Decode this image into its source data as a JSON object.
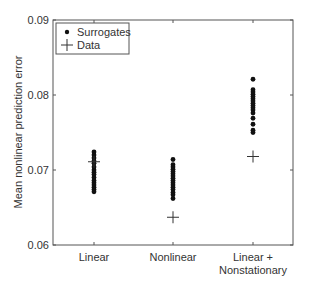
{
  "chart_data": {
    "type": "scatter",
    "title": "",
    "xlabel": "",
    "ylabel": "Mean nonlinear prediction error",
    "ylim": [
      0.06,
      0.09
    ],
    "yticks": [
      "0.06",
      "0.07",
      "0.08",
      "0.09"
    ],
    "categories": [
      "Linear",
      "Nonlinear",
      "Linear + Nonstationary"
    ],
    "category_labels": [
      [
        "Linear"
      ],
      [
        "Nonlinear"
      ],
      [
        "Linear +",
        "Nonstationary"
      ]
    ],
    "grid": false,
    "legend": {
      "position": "upper left",
      "entries": [
        "Surrogates",
        "Data"
      ]
    },
    "series": [
      {
        "name": "Surrogates",
        "marker": "dot",
        "values": [
          [
            0.0724,
            0.072,
            0.0716,
            0.0712,
            0.0709,
            0.0704,
            0.07,
            0.0697,
            0.0694,
            0.069,
            0.0686,
            0.0683,
            0.068,
            0.0677,
            0.0674,
            0.0671
          ],
          [
            0.0714,
            0.0707,
            0.0704,
            0.0701,
            0.0698,
            0.0695,
            0.0692,
            0.0689,
            0.0686,
            0.0683,
            0.068,
            0.0677,
            0.0674,
            0.067,
            0.0667,
            0.0662
          ],
          [
            0.0821,
            0.0807,
            0.0804,
            0.0801,
            0.0798,
            0.0795,
            0.0792,
            0.0789,
            0.0786,
            0.0783,
            0.078,
            0.0776,
            0.0769,
            0.0761,
            0.0753,
            0.075
          ]
        ]
      },
      {
        "name": "Data",
        "marker": "plus",
        "values": [
          0.0711,
          0.0637,
          0.0718
        ]
      }
    ]
  }
}
